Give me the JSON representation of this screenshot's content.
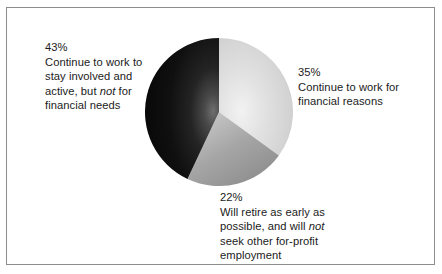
{
  "chart_data": {
    "type": "pie",
    "title": "",
    "subtitle": "",
    "xlabel": "",
    "ylabel": "",
    "legend_position": "callout-labels",
    "grid": false,
    "start_angle_deg": 0,
    "direction": "clockwise",
    "categories": [
      "Continue to work for financial reasons",
      "Will retire as early as possible, and will not seek other for-profit employment",
      "Continue to work to stay involved and active, but not for financial needs"
    ],
    "values": [
      35,
      22,
      43
    ],
    "value_unit": "percent",
    "slice_colors": [
      "#d4d4d4",
      "#9a9a9a",
      "#161616"
    ],
    "slices": [
      {
        "label": "Continue to work for financial reasons",
        "percent": 35,
        "percent_text": "35%",
        "color": "#d4d4d4",
        "angle_deg": 126
      },
      {
        "label": "Will retire as early as possible, and will not seek other for-profit employment",
        "percent": 22,
        "percent_text": "22%",
        "color": "#9a9a9a",
        "angle_deg": 79.2
      },
      {
        "label": "Continue to work to stay involved and active, but not for financial needs",
        "percent": 43,
        "percent_text": "43%",
        "color": "#161616",
        "angle_deg": 154.8
      }
    ]
  },
  "labels": {
    "left": {
      "percent": "43%",
      "line1": "Continue to work to",
      "line2": "stay involved and",
      "line3_pre": "active, but ",
      "line3_em": "not",
      "line3_post": " for",
      "line4": "financial needs"
    },
    "right": {
      "percent": "35%",
      "line1": "Continue to work for",
      "line2": "financial reasons"
    },
    "bottom": {
      "percent": "22%",
      "line1": "Will retire as early as",
      "line2_pre": "possible, and will ",
      "line2_em": "not",
      "line3": "seek other for-profit",
      "line4": "employment"
    }
  },
  "colors": {
    "frame_border": "#8d8d8d",
    "background": "#ffffff",
    "text": "#1b1b1b"
  }
}
